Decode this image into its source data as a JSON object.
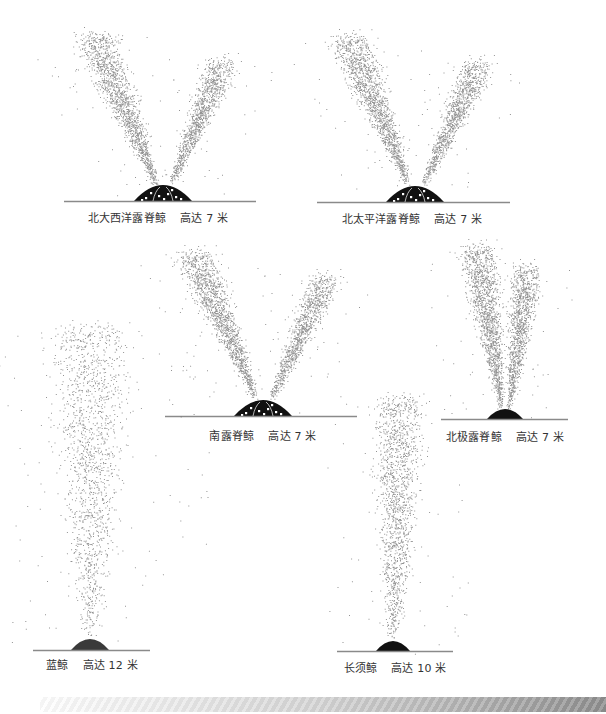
{
  "figure": {
    "colors": {
      "background": "#ffffff",
      "spray_dot": "#6f6f6f",
      "ground_line": "#8a8a8a",
      "whale_back": "#111111",
      "label_text": "#333333"
    }
  },
  "spouts": [
    {
      "id": "north-atlantic-humpback",
      "species": "北大西洋露脊鲸",
      "height_label": "高达 7 米",
      "shape": "v-bushy",
      "ground": {
        "x1": 64,
        "x2": 256,
        "y": 201
      },
      "hump": {
        "cx": 163,
        "w": 58,
        "h": 16,
        "spotted": true
      },
      "plumes": [
        {
          "bx": 157,
          "by": 186,
          "tx": 95,
          "ty": 40,
          "topw": 62,
          "n": 1500
        },
        {
          "bx": 170,
          "by": 186,
          "tx": 222,
          "ty": 66,
          "topw": 48,
          "n": 1100
        }
      ],
      "label": {
        "x": 158,
        "y": 209
      }
    },
    {
      "id": "north-pacific-humpback",
      "species": "北太平洋露脊鲸",
      "height_label": "高达 7 米",
      "shape": "v-bushy",
      "ground": {
        "x1": 317,
        "x2": 510,
        "y": 202
      },
      "hump": {
        "cx": 415,
        "w": 58,
        "h": 16,
        "spotted": true
      },
      "plumes": [
        {
          "bx": 409,
          "by": 187,
          "tx": 350,
          "ty": 42,
          "topw": 62,
          "n": 1500
        },
        {
          "bx": 422,
          "by": 187,
          "tx": 478,
          "ty": 68,
          "topw": 48,
          "n": 1100
        }
      ],
      "label": {
        "x": 412,
        "y": 210
      }
    },
    {
      "id": "southern-right",
      "species": "南露脊鲸",
      "height_label": "高达 7 米",
      "shape": "v-bushy",
      "ground": {
        "x1": 165,
        "x2": 357,
        "y": 416
      },
      "hump": {
        "cx": 263,
        "w": 58,
        "h": 16,
        "spotted": true
      },
      "plumes": [
        {
          "bx": 257,
          "by": 401,
          "tx": 195,
          "ty": 258,
          "topw": 60,
          "n": 1450
        },
        {
          "bx": 270,
          "by": 401,
          "tx": 325,
          "ty": 282,
          "topw": 46,
          "n": 1050
        }
      ],
      "label": {
        "x": 263,
        "y": 427
      }
    },
    {
      "id": "bowhead",
      "species": "北极露脊鲸",
      "height_label": "高达 7 米",
      "shape": "v-tall",
      "ground": {
        "x1": 441,
        "x2": 568,
        "y": 419
      },
      "hump": {
        "cx": 505,
        "w": 36,
        "h": 10,
        "spotted": false
      },
      "plumes": [
        {
          "bx": 502,
          "by": 412,
          "tx": 478,
          "ty": 252,
          "topw": 54,
          "n": 1500
        },
        {
          "bx": 508,
          "by": 412,
          "tx": 528,
          "ty": 272,
          "topw": 44,
          "n": 1150
        }
      ],
      "label": {
        "x": 505,
        "y": 428
      }
    },
    {
      "id": "blue-whale",
      "species": "蓝鲸",
      "height_label": "高达 12 米",
      "shape": "column-wide",
      "ground": {
        "x1": 33,
        "x2": 150,
        "y": 650
      },
      "hump": {
        "cx": 90,
        "w": 38,
        "h": 11,
        "spotted": false
      },
      "plumes": [
        {
          "bx": 90,
          "by": 644,
          "tx": 92,
          "ty": 330,
          "topw": 112,
          "n": 4200
        }
      ],
      "label": {
        "x": 92,
        "y": 656
      }
    },
    {
      "id": "fin-whale",
      "species": "长须鲸",
      "height_label": "高达 10 米",
      "shape": "column-narrow",
      "ground": {
        "x1": 337,
        "x2": 453,
        "y": 651
      },
      "hump": {
        "cx": 393,
        "w": 34,
        "h": 10,
        "spotted": false
      },
      "plumes": [
        {
          "bx": 393,
          "by": 645,
          "tx": 400,
          "ty": 402,
          "topw": 68,
          "n": 2300
        }
      ],
      "label": {
        "x": 395,
        "y": 659
      }
    }
  ],
  "footer": {
    "band": "gradient-stripe"
  }
}
